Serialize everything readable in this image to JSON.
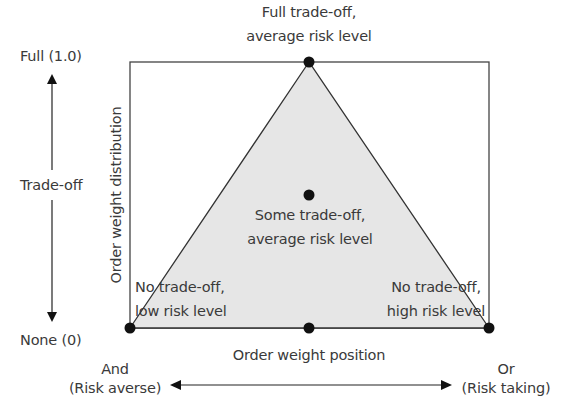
{
  "diagram": {
    "type": "triangle-region",
    "y_axis": {
      "label": "Order weight distribution",
      "top": "Full (1.0)",
      "middle": "Trade-off",
      "bottom": "None (0)"
    },
    "x_axis": {
      "label": "Order weight position",
      "left_line1": "And",
      "left_line2": "(Risk averse)",
      "right_line1": "Or",
      "right_line2": "(Risk taking)"
    },
    "points": {
      "apex_line1": "Full trade-off,",
      "apex_line2": "average risk level",
      "center_line1": "Some trade-off,",
      "center_line2": "average risk level",
      "left_line1": "No trade-off,",
      "left_line2": "low risk level",
      "right_line1": "No trade-off,",
      "right_line2": "high risk level"
    },
    "colors": {
      "fill": "#e6e6e6",
      "stroke": "#333333",
      "dot": "#111111"
    }
  }
}
